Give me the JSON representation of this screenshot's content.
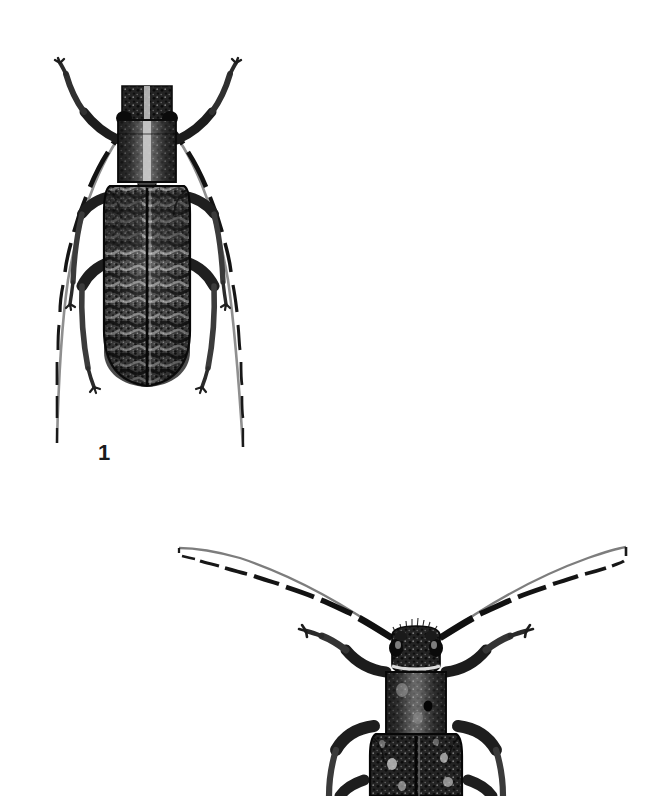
{
  "plate": {
    "kind": "scientific-illustration-plate",
    "subject": "longhorn beetles (Cerambycidae), dorsal view",
    "background_color": "#ffffff",
    "ink_color": "#1b1b1b",
    "width": 661,
    "height": 796
  },
  "figures": [
    {
      "id": "figure-1",
      "label": "1",
      "label_position": {
        "x": 98,
        "y": 442
      },
      "complete": true,
      "description": "Whole beetle in dorsal view with long banded antennae and six legs",
      "body": {
        "center_x": 147,
        "head_top_y": 86,
        "abdomen_bottom_y": 386,
        "elytra_width": 78
      },
      "antennae": {
        "count": 2,
        "banded": true,
        "segments": 11,
        "left_tip": {
          "x": 57,
          "y": 443
        },
        "right_tip": {
          "x": 243,
          "y": 447
        }
      },
      "legs": {
        "count": 6
      }
    },
    {
      "id": "figure-2",
      "label": "",
      "complete": false,
      "description": "Head, pronotum and anterior elytra of a second beetle; body cropped by the lower edge of the plate",
      "body": {
        "center_x": 415,
        "head_top_y": 622,
        "visible_bottom_y": 796,
        "elytra_width": 86
      },
      "antennae": {
        "count": 2,
        "banded": true,
        "segments": 11,
        "left_tip": {
          "x": 179,
          "y": 548
        },
        "right_tip": {
          "x": 626,
          "y": 547
        }
      },
      "legs": {
        "count": 4
      }
    }
  ]
}
